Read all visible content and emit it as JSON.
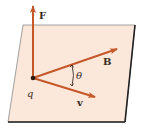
{
  "diagram": {
    "type": "vector-diagram",
    "colors": {
      "plane_fill": "#fbe8da",
      "plane_edge": "#6a6a6a",
      "plane_shadow": "#222222",
      "vector": "#c4582a",
      "charge": "#2a1a14",
      "text": "#3a2a24"
    },
    "labels": {
      "force": "F",
      "field": "B",
      "velocity": "v",
      "charge": "q",
      "angle": "θ"
    },
    "vectors": [
      {
        "name": "F",
        "from": [
          33,
          78
        ],
        "to": [
          33,
          5
        ],
        "direction": "perpendicular to plane"
      },
      {
        "name": "B",
        "from": [
          33,
          78
        ],
        "to": [
          118,
          48
        ],
        "direction": "in plane"
      },
      {
        "name": "v",
        "from": [
          33,
          78
        ],
        "to": [
          96,
          97
        ],
        "direction": "in plane"
      }
    ],
    "angle_between": [
      "v",
      "B"
    ]
  }
}
